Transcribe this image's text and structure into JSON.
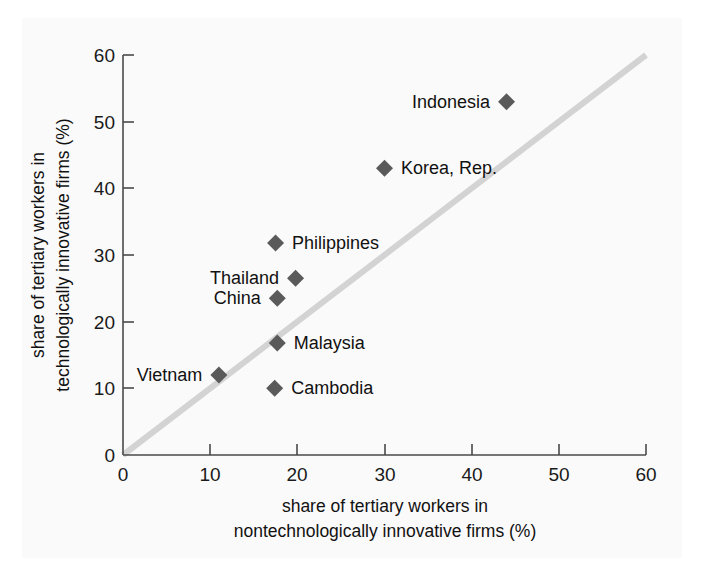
{
  "chart_data": {
    "type": "scatter",
    "title": "",
    "xlabel": "share of tertiary workers in nontechnologically innovative firms (%)",
    "xlabel_line1": "share of tertiary workers in",
    "xlabel_line2": "nontechnologically innovative firms (%)",
    "ylabel": "share of tertiary workers in technologically innovative firms (%)",
    "ylabel_line1": "share of tertiary workers in",
    "ylabel_line2": "technologically innovative firms (%)",
    "xlim": [
      0,
      60
    ],
    "ylim": [
      0,
      60
    ],
    "xticks": [
      0,
      10,
      20,
      30,
      40,
      50,
      60
    ],
    "yticks": [
      0,
      10,
      20,
      30,
      40,
      50,
      60
    ],
    "grid": false,
    "legend": "none",
    "reference_line": {
      "name": "45-degree-line",
      "from": [
        0,
        0
      ],
      "to": [
        60,
        60
      ],
      "color": "#d3d3d3"
    },
    "marker_color": "#5a5a5a",
    "marker_shape": "diamond",
    "points": [
      {
        "label": "Indonesia",
        "x": 44.0,
        "y": 53.0,
        "label_side": "left"
      },
      {
        "label": "Korea, Rep.",
        "x": 30.0,
        "y": 43.0,
        "label_side": "right"
      },
      {
        "label": "Philippines",
        "x": 17.5,
        "y": 31.8,
        "label_side": "right"
      },
      {
        "label": "Thailand",
        "x": 19.8,
        "y": 26.5,
        "label_side": "left"
      },
      {
        "label": "China",
        "x": 17.7,
        "y": 23.5,
        "label_side": "left"
      },
      {
        "label": "Malaysia",
        "x": 17.7,
        "y": 16.8,
        "label_side": "right"
      },
      {
        "label": "Vietnam",
        "x": 11.0,
        "y": 12.0,
        "label_side": "left"
      },
      {
        "label": "Cambodia",
        "x": 17.4,
        "y": 10.0,
        "label_side": "right"
      }
    ]
  },
  "axes": {
    "x_tick_labels": [
      "0",
      "10",
      "20",
      "30",
      "40",
      "50",
      "60"
    ],
    "y_tick_labels": [
      "0",
      "10",
      "20",
      "30",
      "40",
      "50",
      "60"
    ]
  },
  "labels": {
    "indonesia": "Indonesia",
    "korea": "Korea, Rep.",
    "philippines": "Philippines",
    "thailand": "Thailand",
    "china": "China",
    "malaysia": "Malaysia",
    "vietnam": "Vietnam",
    "cambodia": "Cambodia"
  },
  "colors": {
    "marker": "#5a5a5a",
    "reference_line": "#d3d3d3",
    "axis": "#4a4a4a",
    "text": "#111111",
    "background": "#fbfafa"
  }
}
